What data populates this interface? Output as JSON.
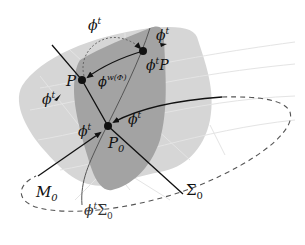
{
  "figure": {
    "colors": {
      "outer_surface": "#d6d6d6",
      "inner_region": "#a3a3a3",
      "grid_lines": "#e6e6e6",
      "curves": "#111111",
      "dashed": "#555555"
    },
    "points": [
      {
        "id": "P",
        "label": "P",
        "x": 82,
        "y": 80
      },
      {
        "id": "phiP",
        "label_main": "ϕ",
        "label_sup": "t",
        "label_tail": "P",
        "x": 143,
        "y": 51
      },
      {
        "id": "P0",
        "label_main": "P",
        "label_sub": "0",
        "x": 108,
        "y": 126
      }
    ],
    "labels": {
      "phi_t": {
        "main": "ϕ",
        "sup": "t"
      },
      "phi_w": {
        "main": "ϕ",
        "sup": "w(Φ)"
      },
      "M0": {
        "main": "M",
        "sub": "0"
      },
      "Sigma0": {
        "main": "Σ",
        "sub": "0"
      },
      "phi_t_Sigma0": {
        "main": "ϕ",
        "sup": "t",
        "tail": "Σ",
        "tail_sub": "0"
      }
    }
  }
}
